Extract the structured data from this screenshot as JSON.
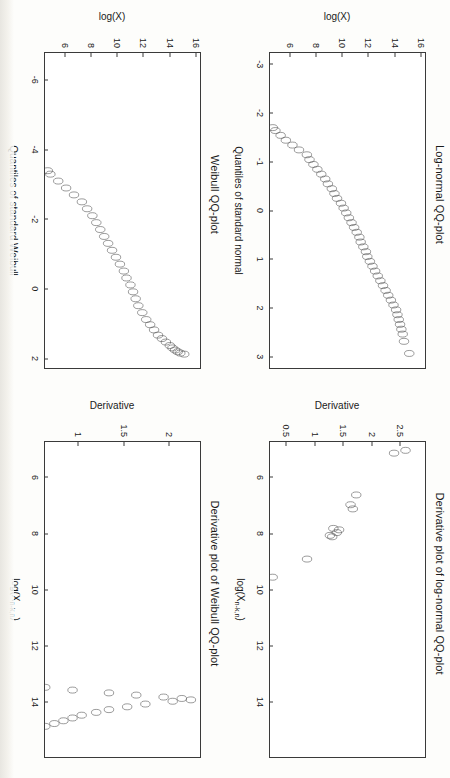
{
  "figure": {
    "orientation": "rotated-90-clockwise",
    "panels": [
      "lognormal-qq",
      "lognormal-derivative",
      "weibull-qq",
      "weibull-derivative"
    ]
  },
  "chart_data": [
    {
      "id": "lognormal-qq",
      "type": "scatter",
      "title": "Log-normal QQ-plot",
      "xlabel": "Quantiles of standard normal",
      "ylabel": "log(X)",
      "xlim": [
        -3.25,
        3.25
      ],
      "ylim": [
        4.4,
        16.4
      ],
      "xticks": [
        -3,
        -2,
        -1,
        0,
        1,
        2,
        3
      ],
      "yticks": [
        6,
        8,
        10,
        12,
        14,
        16
      ],
      "grid": false,
      "legend": "none",
      "x": [
        -3.05,
        -2.72,
        -2.52,
        -2.4,
        -2.31,
        -2.24,
        -2.18,
        -2.12,
        -2.07,
        -2.02,
        -1.98,
        -1.94,
        -1.9,
        -1.86,
        -1.83,
        -1.8,
        -1.77,
        -1.74,
        -1.71,
        -1.65,
        -1.55,
        -1.45,
        -1.35,
        -1.25,
        -1.15,
        -1.05,
        -0.95,
        -0.85,
        -0.75,
        -0.65,
        -0.55,
        -0.45,
        -0.35,
        -0.25,
        -0.15,
        -0.05,
        0.05,
        0.15,
        0.25,
        0.35,
        0.45,
        0.55,
        0.65,
        0.75,
        0.85,
        0.95,
        1.05,
        1.15,
        1.25,
        1.35,
        1.45,
        1.55,
        1.65,
        1.75,
        1.85,
        1.95,
        2.05,
        2.15,
        2.25,
        2.35,
        2.45,
        2.55,
        2.7,
        2.95
      ],
      "y": [
        4.9,
        5.0,
        6.7,
        6.9,
        7.1,
        7.4,
        7.6,
        7.8,
        7.95,
        8.1,
        8.2,
        8.35,
        8.5,
        8.9,
        9.1,
        9.5,
        9.9,
        10.2,
        10.6,
        10.7,
        10.9,
        11.1,
        11.35,
        11.6,
        11.9,
        12.0,
        12.15,
        12.3,
        12.45,
        12.6,
        12.7,
        12.85,
        12.95,
        13.05,
        13.2,
        13.3,
        13.4,
        13.5,
        13.6,
        13.7,
        13.8,
        13.9,
        13.95,
        14.05,
        14.15,
        14.2,
        14.3,
        14.4,
        14.5,
        14.6,
        14.7,
        14.8,
        14.9,
        15.0,
        15.1,
        15.2,
        15.3,
        15.35,
        15.4,
        15.45,
        15.5,
        15.55,
        15.6,
        15.8
      ]
    },
    {
      "id": "lognormal-derivative",
      "type": "scatter",
      "title": "Derivative plot of log-normal QQ-plot",
      "xlabel": "log(X_{n-k,n})",
      "ylabel": "Derivative",
      "xlim": [
        4.7,
        16.0
      ],
      "ylim": [
        0.2,
        2.95
      ],
      "xticks": [
        6,
        8,
        10,
        12,
        14
      ],
      "yticks": [
        0.5,
        1.0,
        1.5,
        2.0,
        2.5
      ],
      "grid": false,
      "legend": "none",
      "x": [
        5.0,
        5.1,
        6.6,
        6.95,
        7.1,
        7.8,
        7.85,
        7.95,
        8.05,
        8.1,
        8.9,
        9.55,
        10.05,
        10.55,
        10.85,
        10.95,
        11.1,
        11.3,
        11.5,
        11.7,
        11.8,
        11.9,
        11.95,
        12.05,
        12.15,
        12.25,
        12.35,
        12.45,
        12.55,
        12.65,
        12.75,
        12.85,
        12.95,
        13.05,
        13.15,
        13.25,
        13.35,
        13.45,
        13.55,
        13.6,
        13.65,
        13.7,
        13.75,
        13.8,
        13.85,
        13.9,
        13.95,
        14.05,
        14.15,
        14.25,
        14.35,
        14.45,
        14.55,
        14.65,
        14.75,
        14.85,
        14.95,
        15.05,
        15.15,
        15.25,
        15.35,
        15.45,
        15.55,
        15.7
      ],
      "y": [
        2.78,
        2.68,
        2.35,
        2.3,
        2.32,
        2.15,
        2.2,
        2.18,
        2.12,
        2.14,
        1.92,
        1.62,
        1.35,
        1.2,
        1.15,
        1.25,
        1.3,
        1.35,
        1.4,
        1.12,
        1.05,
        1.0,
        0.95,
        0.92,
        0.9,
        0.88,
        0.86,
        0.85,
        0.87,
        0.9,
        0.95,
        1.0,
        1.05,
        1.1,
        1.15,
        1.2,
        1.3,
        1.4,
        1.48,
        1.5,
        1.52,
        1.5,
        1.45,
        1.4,
        1.35,
        1.3,
        1.25,
        1.2,
        1.1,
        1.05,
        0.95,
        0.9,
        0.85,
        0.8,
        0.75,
        0.7,
        0.65,
        0.6,
        0.58,
        0.55,
        0.52,
        0.5,
        0.48,
        0.3
      ]
    },
    {
      "id": "weibull-qq",
      "type": "scatter",
      "title": "Weibull QQ-plot",
      "xlabel": "Quantiles of standard Weibull",
      "ylabel": "log(X)",
      "xlim": [
        -6.8,
        2.3
      ],
      "ylim": [
        4.4,
        16.4
      ],
      "xticks": [
        -6,
        -4,
        -2,
        0,
        2
      ],
      "yticks": [
        6,
        8,
        10,
        12,
        14,
        16
      ],
      "grid": false,
      "legend": "none",
      "x": [
        -6.55,
        -5.85,
        -5.4,
        -5.15,
        -4.9,
        -4.7,
        -4.5,
        -4.35,
        -4.2,
        -4.1,
        -4.0,
        -3.9,
        -3.8,
        -3.7,
        -3.6,
        -3.5,
        -3.45,
        -3.4,
        -3.3,
        -3.1,
        -2.9,
        -2.7,
        -2.5,
        -2.3,
        -2.1,
        -1.9,
        -1.7,
        -1.5,
        -1.3,
        -1.1,
        -0.9,
        -0.7,
        -0.5,
        -0.3,
        -0.1,
        0.1,
        0.3,
        0.5,
        0.7,
        0.9,
        1.05,
        1.2,
        1.35,
        1.45,
        1.55,
        1.65,
        1.72,
        1.78,
        1.83,
        1.87,
        1.9
      ],
      "y": [
        4.9,
        5.0,
        6.7,
        6.9,
        7.1,
        7.4,
        7.6,
        7.8,
        8.0,
        8.2,
        8.5,
        8.6,
        8.9,
        9.2,
        9.5,
        9.9,
        10.2,
        10.6,
        10.7,
        11.0,
        11.3,
        11.6,
        11.9,
        12.1,
        12.3,
        12.45,
        12.6,
        12.75,
        12.9,
        13.05,
        13.2,
        13.35,
        13.5,
        13.6,
        13.75,
        13.85,
        13.95,
        14.05,
        14.2,
        14.35,
        14.5,
        14.65,
        14.8,
        14.95,
        15.1,
        15.25,
        15.35,
        15.45,
        15.55,
        15.65,
        15.8
      ]
    },
    {
      "id": "weibull-derivative",
      "type": "scatter",
      "title": "Derivative plot of Weibull QQ-plot",
      "xlabel": "log(X_{n-k,n})",
      "ylabel": "Derivative",
      "xlim": [
        4.7,
        16.0
      ],
      "ylim": [
        0.62,
        2.35
      ],
      "xticks": [
        6,
        8,
        10,
        12,
        14
      ],
      "yticks": [
        1.0,
        1.5,
        2.0
      ],
      "grid": false,
      "legend": "none",
      "x": [
        5.0,
        5.1,
        6.6,
        6.95,
        7.1,
        7.8,
        7.85,
        7.95,
        8.05,
        8.15,
        8.9,
        9.55,
        10.05,
        10.55,
        10.85,
        10.95,
        11.1,
        11.3,
        11.5,
        11.7,
        11.8,
        11.9,
        12.05,
        12.2,
        12.35,
        12.5,
        12.65,
        12.8,
        12.95,
        13.1,
        13.25,
        13.4,
        13.5,
        13.6,
        13.7,
        13.78,
        13.85,
        13.9,
        13.95,
        14.0,
        14.1,
        14.2,
        14.3,
        14.4,
        14.5,
        14.6,
        14.7,
        14.8,
        14.9,
        15.0,
        15.1,
        15.2,
        15.3,
        15.4,
        15.5,
        15.6,
        15.7
      ],
      "y": [
        1.38,
        1.3,
        1.3,
        1.28,
        1.32,
        1.3,
        1.28,
        1.3,
        1.25,
        1.26,
        1.3,
        1.2,
        1.1,
        0.95,
        0.8,
        0.82,
        0.85,
        0.8,
        0.78,
        0.8,
        0.82,
        0.85,
        0.86,
        0.88,
        0.9,
        0.92,
        0.95,
        1.0,
        1.05,
        1.12,
        1.2,
        1.35,
        1.5,
        1.65,
        1.85,
        2.0,
        2.15,
        2.25,
        2.3,
        2.2,
        2.05,
        1.95,
        1.85,
        1.78,
        1.7,
        1.65,
        1.6,
        1.55,
        1.5,
        1.45,
        1.42,
        1.4,
        1.38,
        1.36,
        1.34,
        1.32,
        0.68
      ]
    }
  ],
  "panels": {
    "lognormal_qq": {
      "title": "Log-normal QQ-plot",
      "xlabel": "Quantiles of standard normal",
      "ylabel": "log(X)",
      "xticks": [
        "-3",
        "-2",
        "-1",
        "0",
        "1",
        "2",
        "3"
      ],
      "yticks": [
        "6",
        "8",
        "10",
        "12",
        "14",
        "16"
      ]
    },
    "lognormal_derivative": {
      "title": "Derivative plot of log-normal QQ-plot",
      "xlabel_main": "log(X",
      "xlabel_sub": "n-k,n",
      "xlabel_close": ")",
      "ylabel": "Derivative",
      "xticks": [
        "6",
        "8",
        "10",
        "12",
        "14"
      ],
      "yticks": [
        "0.5",
        "1.0",
        "1.5",
        "2.0",
        "2.5"
      ]
    },
    "weibull_qq": {
      "title": "Weibull QQ-plot",
      "xlabel": "Quantiles of standard Weibull",
      "ylabel": "log(X)",
      "xticks": [
        "-6",
        "-4",
        "-2",
        "0",
        "2"
      ],
      "yticks": [
        "6",
        "8",
        "10",
        "12",
        "14",
        "16"
      ]
    },
    "weibull_derivative": {
      "title": "Derivative plot of Weibull QQ-plot",
      "xlabel_main": "log(X",
      "xlabel_sub": "n-k,n",
      "xlabel_close": ")",
      "ylabel": "Derivative",
      "xticks": [
        "6",
        "8",
        "10",
        "12",
        "14"
      ],
      "yticks": [
        "1.0",
        "1.5",
        "2.0"
      ]
    }
  },
  "colors": {
    "point_stroke": "#4a4a4a",
    "axis": "#3a3a3a",
    "background": "#ffffff",
    "page": "#fdfdfb"
  }
}
